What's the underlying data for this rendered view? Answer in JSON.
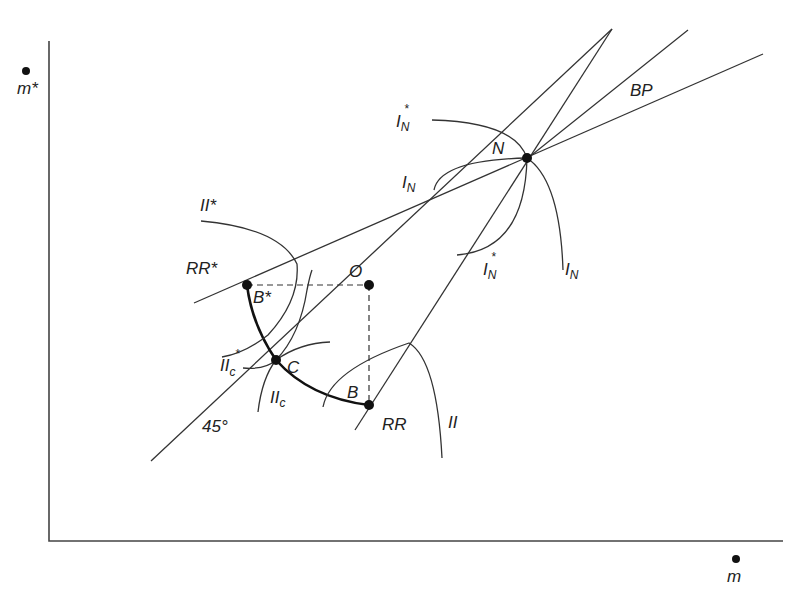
{
  "diagram": {
    "axes": {
      "y_label": "m*",
      "x_label": "m",
      "y_dot": "dot-over-m-star",
      "x_dot": "dot-over-m"
    },
    "points": {
      "N": "N",
      "O": "O",
      "B": "B",
      "B_star": "B*",
      "C": "C"
    },
    "lines": {
      "BP": "BP",
      "RR": "RR",
      "RR_star": "RR*",
      "line_45": "45°"
    },
    "curves": {
      "II": "II",
      "II_star": "II*",
      "II_c": "II",
      "II_c_sub": "c",
      "II_c_star": "II",
      "II_c_star_sub": "c",
      "II_c_star_sup": "*",
      "I_N_upper": "I",
      "I_N_sub": "N",
      "I_N_star": "I",
      "I_N_star_sup": "*"
    },
    "colors": {
      "line": "#333333",
      "axis": "#444444",
      "contract_curve": "#111111",
      "background": "#ffffff"
    }
  }
}
